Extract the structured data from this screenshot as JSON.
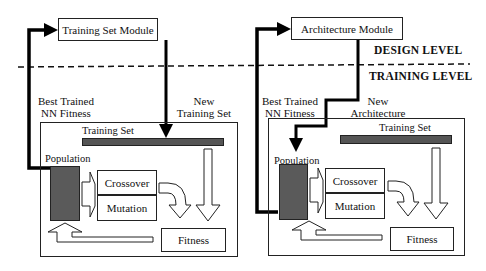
{
  "levels": {
    "design": "DESIGN LEVEL",
    "training": "TRAINING LEVEL"
  },
  "left_panel": {
    "module": "Training Set Module",
    "feedback_label_line1": "Best Trained",
    "feedback_label_line2": "NN Fitness",
    "output_label_line1": "New",
    "output_label_line2": "Training Set",
    "training_set": "Training Set",
    "population": "Population",
    "crossover": "Crossover",
    "mutation": "Mutation",
    "fitness": "Fitness"
  },
  "right_panel": {
    "module": "Architecture Module",
    "feedback_label_line1": "Best Trained",
    "feedback_label_line2": "NN Fitness",
    "output_label_line1": "New",
    "output_label_line2": "Architecture",
    "training_set": "Training Set",
    "population": "Population",
    "crossover": "Crossover",
    "mutation": "Mutation",
    "fitness": "Fitness"
  },
  "colors": {
    "line": "#111111",
    "fill_dark": "#5a5a5a",
    "background": "#ffffff"
  }
}
